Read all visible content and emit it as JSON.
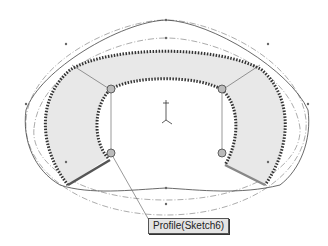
{
  "viewport": {
    "background": "#ffffff",
    "shape_fill": "#e8e8e8",
    "edge_color": "#333333",
    "guide_color": "#777777"
  },
  "callout": {
    "label": "Profile(Sketch6)"
  },
  "triad": {
    "axes": [
      "y",
      "x",
      "z"
    ]
  }
}
